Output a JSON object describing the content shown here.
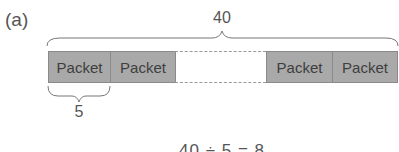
{
  "figure": {
    "panel_label": "(a)",
    "total_label": "40",
    "unit_label": "5",
    "formula": "40 ÷ 5 = 8",
    "packets": [
      {
        "label": "Packet"
      },
      {
        "label": "Packet"
      },
      {
        "label": "Packet"
      },
      {
        "label": "Packet"
      }
    ],
    "colors": {
      "packet_fill": "#a9a9a9",
      "packet_border": "#8a8a8a",
      "line": "#777777"
    }
  }
}
